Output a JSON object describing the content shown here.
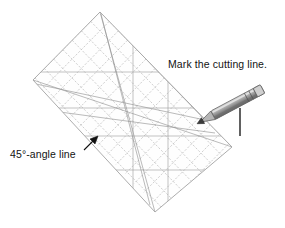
{
  "figure": {
    "background_color": "#ffffff",
    "width": 285,
    "height": 228
  },
  "labels": {
    "cutting_line": "Mark the cutting line.",
    "angle_line": "45°-angle line"
  },
  "colors": {
    "ruler_grid": "#b9b9b9",
    "ruler_outline": "#9a9a9a",
    "ruler_diagonal": "#8d8d8d",
    "fabric_line": "#1e1e1e",
    "pencil_body": "#9c9c9c",
    "pencil_shade": "#6e6e6e",
    "pencil_tip": "#3a3a3a",
    "arrow": "#111111",
    "text": "#131313"
  },
  "elements": {
    "ruler": {
      "name": "quilting-ruler",
      "shape": "rotated-rectangle",
      "rotation_deg": 45,
      "corners": [
        [
          100,
          12
        ],
        [
          33,
          80
        ],
        [
          155,
          212
        ],
        [
          232,
          147
        ]
      ],
      "grid_spacing_px": 13,
      "has_45_degree_diagonals": true
    },
    "fabric": {
      "top_edge_y": 108,
      "bottom_edge_y": 136,
      "right_edge_x": 240,
      "left_x": 5
    },
    "pencil": {
      "tip_point": [
        206,
        119
      ],
      "end_point": [
        274,
        83
      ],
      "angle_deg": -28
    },
    "arrow_pointer": {
      "tip": [
        97,
        137
      ],
      "tail": [
        86,
        148
      ]
    }
  }
}
